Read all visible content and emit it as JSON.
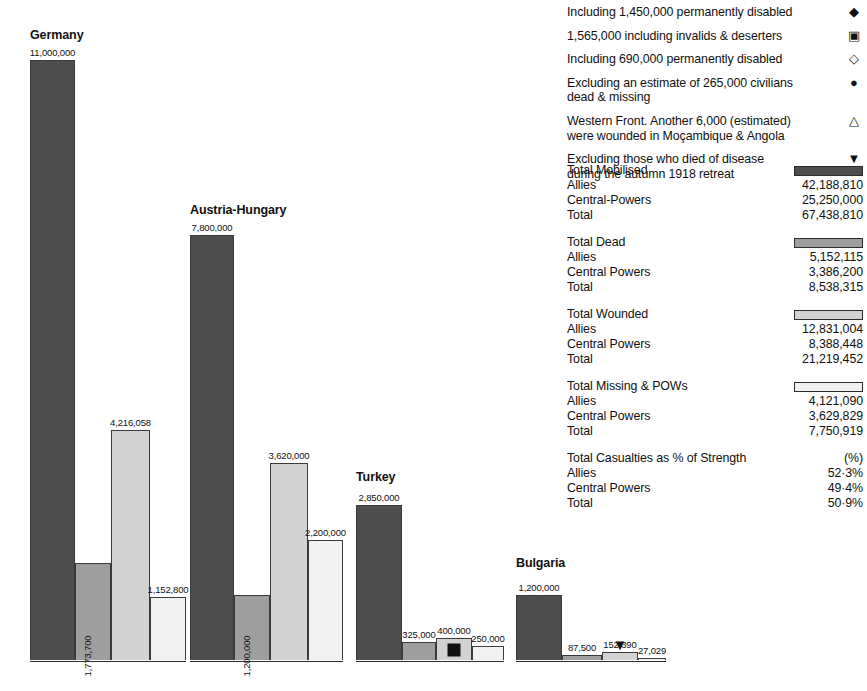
{
  "chart_data": {
    "type": "bar",
    "title": "",
    "xlabel": "",
    "ylabel": "",
    "ylim": [
      0,
      11000000
    ],
    "grid": false,
    "legend_position": "right",
    "categories": [
      "Germany",
      "Austria-Hungary",
      "Turkey",
      "Bulgaria"
    ],
    "series": [
      {
        "name": "Total Mobilised",
        "swatch": "s0",
        "values": [
          11000000,
          7800000,
          2850000,
          1200000
        ]
      },
      {
        "name": "Total Dead",
        "swatch": "s1",
        "values": [
          1773700,
          1200000,
          325000,
          87500
        ]
      },
      {
        "name": "Total Wounded",
        "swatch": "s2",
        "values": [
          4216058,
          3620000,
          400000,
          152390
        ]
      },
      {
        "name": "Total Missing & POWs",
        "swatch": "s3",
        "values": [
          1152800,
          2200000,
          250000,
          27029
        ]
      }
    ],
    "value_labels": [
      [
        "11,000,000",
        "1,773,700",
        "4,216,058",
        "1,152,800"
      ],
      [
        "7,800,000",
        "1,200,000",
        "3,620,000",
        "2,200,000"
      ],
      [
        "2,850,000",
        "325,000",
        "400,000",
        "250,000"
      ],
      [
        "1,200,000",
        "87,500",
        "152,390",
        "27,029"
      ]
    ],
    "annotations": [
      {
        "group": "Turkey",
        "series": "Total Wounded",
        "symbol": "filled-square",
        "placement": "inside"
      },
      {
        "group": "Bulgaria",
        "series": "Total Wounded",
        "symbol": "filled-down-triangle",
        "placement": "below-axis"
      }
    ]
  },
  "groups": [
    {
      "name": "Germany",
      "left": 30,
      "width": 156,
      "title_top": 28,
      "bars": [
        {
          "label": "11,000,000",
          "value": 11000000,
          "swatch": "s0",
          "w": 45,
          "orient": "h"
        },
        {
          "label": "1,773,700",
          "value": 1773700,
          "swatch": "s1",
          "w": 36,
          "orient": "v"
        },
        {
          "label": "4,216,058",
          "value": 4216058,
          "swatch": "s2",
          "w": 39,
          "orient": "h"
        },
        {
          "label": "1,152,800",
          "value": 1152800,
          "swatch": "s3",
          "w": 36,
          "orient": "h"
        }
      ]
    },
    {
      "name": "Austria-Hungary",
      "left": 190,
      "width": 153,
      "title_top": 203,
      "bars": [
        {
          "label": "7,800,000",
          "value": 7800000,
          "swatch": "s0",
          "w": 44,
          "orient": "h"
        },
        {
          "label": "1,200,000",
          "value": 1200000,
          "swatch": "s1",
          "w": 36,
          "orient": "v"
        },
        {
          "label": "3,620,000",
          "value": 3620000,
          "swatch": "s2",
          "w": 38,
          "orient": "h"
        },
        {
          "label": "2,200,000",
          "value": 2200000,
          "swatch": "s3",
          "w": 35,
          "orient": "h"
        }
      ]
    },
    {
      "name": "Turkey",
      "left": 356,
      "width": 148,
      "title_top": 470,
      "bars": [
        {
          "label": "2,850,000",
          "value": 2850000,
          "swatch": "s0",
          "w": 46,
          "orient": "h"
        },
        {
          "label": "325,000",
          "value": 325000,
          "swatch": "s1",
          "w": 34,
          "orient": "h"
        },
        {
          "label": "400,000",
          "value": 400000,
          "swatch": "s2",
          "w": 36,
          "orient": "h",
          "marker": "filled-square"
        },
        {
          "label": "250,000",
          "value": 250000,
          "swatch": "s3",
          "w": 32,
          "orient": "h"
        }
      ]
    },
    {
      "name": "Bulgaria",
      "left": 516,
      "width": 150,
      "title_top": 556,
      "bars": [
        {
          "label": "1,200,000",
          "value": 1200000,
          "swatch": "s0",
          "w": 46,
          "orient": "h"
        },
        {
          "label": "87,500",
          "value": 87500,
          "swatch": "s1",
          "w": 40,
          "orient": "h"
        },
        {
          "label": "152,390",
          "value": 152390,
          "swatch": "s2",
          "w": 36,
          "orient": "h",
          "markerBelow": "▼"
        },
        {
          "label": "27,029",
          "value": 27029,
          "swatch": "s3",
          "w": 28,
          "orient": "h"
        }
      ]
    }
  ],
  "notes": [
    {
      "text": "Including 1,450,000 permanently disabled",
      "symbol": "◆",
      "icon": "filled-diamond-icon"
    },
    {
      "text": "1,565,000 including invalids & deserters",
      "symbol": "▣",
      "icon": "dotted-square-icon"
    },
    {
      "text": "Including 690,000 permanently disabled",
      "symbol": "◇",
      "icon": "open-diamond-icon"
    },
    {
      "text": "Excluding an estimate of 265,000 civilians dead & missing",
      "symbol": "●",
      "icon": "filled-circle-icon"
    },
    {
      "text": "Western Front. Another 6,000 (estimated) were wounded in Moçambique & Angola",
      "symbol": "△",
      "icon": "open-triangle-icon"
    },
    {
      "text": "Excluding those who died of disease during the autumn 1918 retreat",
      "symbol": "▼",
      "icon": "filled-down-triangle-icon"
    }
  ],
  "legend": [
    {
      "title": "Total Mobilised",
      "swatch": "s0",
      "rows": [
        {
          "label": "Allies",
          "value": "42,188,810"
        },
        {
          "label": "Central-Powers",
          "value": "25,250,000"
        },
        {
          "label": "Total",
          "value": "67,438,810"
        }
      ]
    },
    {
      "title": "Total Dead",
      "swatch": "s1",
      "rows": [
        {
          "label": "Allies",
          "value": "5,152,115"
        },
        {
          "label": "Central Powers",
          "value": "3,386,200"
        },
        {
          "label": "Total",
          "value": "8,538,315"
        }
      ]
    },
    {
      "title": "Total Wounded",
      "swatch": "s2",
      "rows": [
        {
          "label": "Allies",
          "value": "12,831,004"
        },
        {
          "label": "Central Powers",
          "value": "8,388,448"
        },
        {
          "label": "Total",
          "value": "21,219,452"
        }
      ]
    },
    {
      "title": "Total Missing & POWs",
      "swatch": "s3",
      "rows": [
        {
          "label": "Allies",
          "value": "4,121,090"
        },
        {
          "label": "Central Powers",
          "value": "3,629,829"
        },
        {
          "label": "Total",
          "value": "7,750,919"
        }
      ]
    },
    {
      "title": "Total Casualties as % of Strength",
      "pct_head": "(%)",
      "rows": [
        {
          "label": "Allies",
          "value": "52·3%"
        },
        {
          "label": "Central Powers",
          "value": "49·4%"
        },
        {
          "label": "Total",
          "value": "50·9%"
        }
      ]
    }
  ],
  "scale": {
    "max_value": 11000000,
    "max_px": 600,
    "baseline_y": 660
  }
}
